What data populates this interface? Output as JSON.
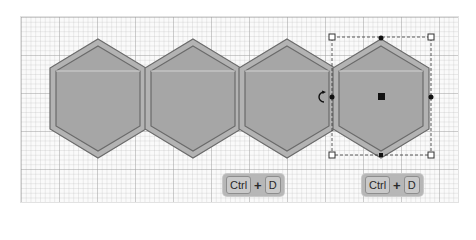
{
  "canvas": {
    "grid": "minor/major grid",
    "colors": {
      "hex_fill": "#a6a6a6",
      "hex_border": "#b3b3b3",
      "hex_stroke": "#6f6f6f",
      "selection": "#333333"
    }
  },
  "shapes": [
    {
      "type": "hexagon",
      "index": 1,
      "selected": false
    },
    {
      "type": "hexagon",
      "index": 2,
      "selected": false
    },
    {
      "type": "hexagon",
      "index": 3,
      "selected": false
    },
    {
      "type": "hexagon",
      "index": 4,
      "selected": true
    }
  ],
  "selection": {
    "handles": [
      "top-left",
      "top",
      "top-right",
      "left",
      "right",
      "bottom-left",
      "bottom",
      "bottom-right",
      "center"
    ],
    "rotate_icon": "rotate-icon"
  },
  "shortcuts": [
    {
      "key1": "Ctrl",
      "plus": "+",
      "key2": "D"
    },
    {
      "key1": "Ctrl",
      "plus": "+",
      "key2": "D"
    }
  ]
}
